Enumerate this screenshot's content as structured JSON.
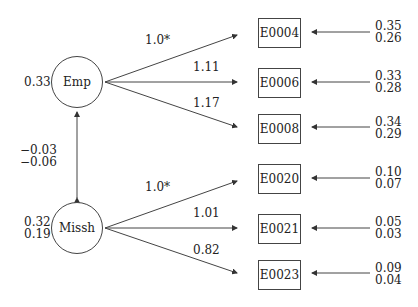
{
  "latents": [
    {
      "id": "emp",
      "label": "Emp",
      "variance": [
        "0.33"
      ]
    },
    {
      "id": "missh",
      "label": "Missh",
      "variance": [
        "0.32",
        "0.19"
      ]
    }
  ],
  "covariance": {
    "values": [
      "−0.03",
      "−0.06"
    ]
  },
  "indicators": [
    {
      "label": "E0004",
      "loading": "1.0*",
      "error": [
        "0.35",
        "0.26"
      ]
    },
    {
      "label": "E0006",
      "loading": "1.11",
      "error": [
        "0.33",
        "0.28"
      ]
    },
    {
      "label": "E0008",
      "loading": "1.17",
      "error": [
        "0.34",
        "0.29"
      ]
    },
    {
      "label": "E0020",
      "loading": "1.0*",
      "error": [
        "0.10",
        "0.07"
      ]
    },
    {
      "label": "E0021",
      "loading": "1.01",
      "error": [
        "0.05",
        "0.03"
      ]
    },
    {
      "label": "E0023",
      "loading": "0.82",
      "error": [
        "0.09",
        "0.04"
      ]
    }
  ]
}
